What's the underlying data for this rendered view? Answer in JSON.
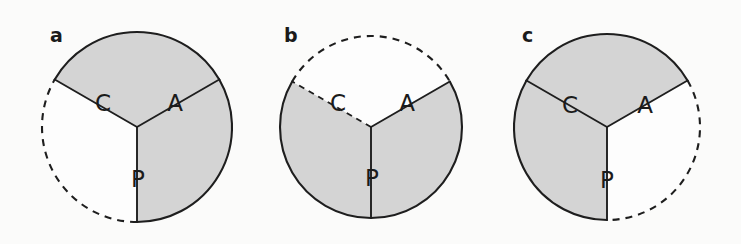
{
  "figure": {
    "background_color": "#fbfbfa",
    "stroke_color": "#1e1e1e",
    "gray_fill_color": "#d4d4d4",
    "white_fill_color": "#fdfdfd",
    "label_color": "#1b1b1b"
  },
  "chart_data": {
    "type": "pie",
    "title": "",
    "xlabel": "",
    "ylabel": "",
    "categories": [
      "C",
      "A",
      "P"
    ],
    "values": [
      33.33,
      33.33,
      33.33
    ],
    "series": [
      {
        "name": "a",
        "values": [
          33.33,
          33.33,
          33.33
        ],
        "fills": [
          "white",
          "gray",
          "gray"
        ],
        "arc_styles": [
          "dashed",
          "solid",
          "solid"
        ]
      },
      {
        "name": "b",
        "values": [
          33.33,
          33.33,
          33.33
        ],
        "fills": [
          "gray",
          "white",
          "gray"
        ],
        "arc_styles": [
          "solid",
          "dashed",
          "solid"
        ]
      },
      {
        "name": "c",
        "values": [
          33.33,
          33.33,
          33.33
        ],
        "fills": [
          "gray",
          "gray",
          "white"
        ],
        "arc_styles": [
          "solid",
          "solid",
          "dashed"
        ]
      }
    ],
    "legend_position": "none",
    "grid": false
  },
  "panels": [
    {
      "letter": "a",
      "letter_x": 50,
      "letter_y": 42,
      "center_x": 137,
      "center_y": 127,
      "radius": 95,
      "sectors": [
        {
          "key": "C",
          "label": "C",
          "label_x": 103,
          "label_y": 104,
          "fill": "#fdfdfd",
          "arc_dashed": true,
          "start_deg": 180,
          "end_deg": 300
        },
        {
          "key": "A",
          "label": "A",
          "label_x": 175,
          "label_y": 104,
          "fill": "#d4d4d4",
          "arc_dashed": false,
          "start_deg": 300,
          "end_deg": 60
        },
        {
          "key": "P",
          "label": "P",
          "label_x": 138,
          "label_y": 180,
          "fill": "#d4d4d4",
          "arc_dashed": false,
          "start_deg": 60,
          "end_deg": 180
        }
      ],
      "spokes": [
        {
          "angle_deg": 300,
          "dashed": false
        },
        {
          "angle_deg": 60,
          "dashed": false
        },
        {
          "angle_deg": 180,
          "dashed": false
        }
      ]
    },
    {
      "letter": "b",
      "letter_x": 284,
      "letter_y": 42,
      "center_x": 371,
      "center_y": 127,
      "radius": 91,
      "sectors": [
        {
          "key": "C",
          "label": "C",
          "label_x": 338,
          "label_y": 104,
          "fill": "#d4d4d4",
          "arc_dashed": false,
          "start_deg": 180,
          "end_deg": 300
        },
        {
          "key": "A",
          "label": "A",
          "label_x": 407,
          "label_y": 104,
          "fill": "#fdfdfd",
          "arc_dashed": true,
          "start_deg": 300,
          "end_deg": 60
        },
        {
          "key": "P",
          "label": "P",
          "label_x": 372,
          "label_y": 179,
          "fill": "#d4d4d4",
          "arc_dashed": false,
          "start_deg": 60,
          "end_deg": 180
        }
      ],
      "spokes": [
        {
          "angle_deg": 300,
          "dashed": true
        },
        {
          "angle_deg": 60,
          "dashed": false
        },
        {
          "angle_deg": 180,
          "dashed": false
        }
      ]
    },
    {
      "letter": "c",
      "letter_x": 522,
      "letter_y": 42,
      "center_x": 607,
      "center_y": 127,
      "radius": 93,
      "sectors": [
        {
          "key": "C",
          "label": "C",
          "label_x": 570,
          "label_y": 106,
          "fill": "#d4d4d4",
          "arc_dashed": false,
          "start_deg": 180,
          "end_deg": 300
        },
        {
          "key": "A",
          "label": "A",
          "label_x": 645,
          "label_y": 106,
          "fill": "#d4d4d4",
          "arc_dashed": false,
          "start_deg": 300,
          "end_deg": 60
        },
        {
          "key": "P",
          "label": "P",
          "label_x": 607,
          "label_y": 181,
          "fill": "#fdfdfd",
          "arc_dashed": true,
          "start_deg": 60,
          "end_deg": 180
        }
      ],
      "spokes": [
        {
          "angle_deg": 300,
          "dashed": false
        },
        {
          "angle_deg": 60,
          "dashed": false
        },
        {
          "angle_deg": 180,
          "dashed": false
        }
      ]
    }
  ]
}
